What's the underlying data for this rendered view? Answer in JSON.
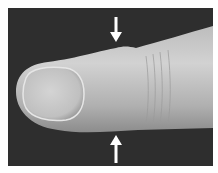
{
  "figure": {
    "colors": {
      "background": "#2e2e2e",
      "skin_light": "#d8d8d8",
      "skin_mid": "#b4b4b4",
      "skin_dark": "#8a8a8a",
      "nail": "#c8c8c8",
      "arrow": "#ffffff"
    },
    "annotations": [
      {
        "type": "arrow",
        "direction": "down",
        "position": "top",
        "x": 116
      },
      {
        "type": "arrow",
        "direction": "up",
        "position": "bottom",
        "x": 116
      }
    ]
  }
}
